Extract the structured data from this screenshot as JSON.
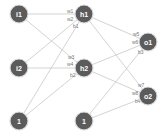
{
  "diagram": {
    "type": "neural-network",
    "layers": [
      "input",
      "hidden",
      "output"
    ],
    "nodes": [
      {
        "id": "i1",
        "label": "i1",
        "x": 19,
        "y": 14
      },
      {
        "id": "i2",
        "label": "i2",
        "x": 19,
        "y": 68
      },
      {
        "id": "b_in",
        "label": "1",
        "x": 19,
        "y": 121
      },
      {
        "id": "h1",
        "label": "h1",
        "x": 84,
        "y": 14
      },
      {
        "id": "h2",
        "label": "h2",
        "x": 84,
        "y": 68
      },
      {
        "id": "b_hid",
        "label": "1",
        "x": 84,
        "y": 121
      },
      {
        "id": "o1",
        "label": "o1",
        "x": 148,
        "y": 42
      },
      {
        "id": "o2",
        "label": "o2",
        "x": 148,
        "y": 96
      }
    ],
    "edges": [
      {
        "from": "i1",
        "to": "h1",
        "label": "w1",
        "lx": 67,
        "ly": 13
      },
      {
        "from": "i2",
        "to": "h1",
        "label": "w2",
        "lx": 67,
        "ly": 21
      },
      {
        "from": "b_in",
        "to": "h1",
        "label": "b1",
        "lx": 73,
        "ly": 28
      },
      {
        "from": "i1",
        "to": "h2",
        "label": "w3",
        "lx": 68,
        "ly": 59
      },
      {
        "from": "i2",
        "to": "h2",
        "label": "w4",
        "lx": 67,
        "ly": 66
      },
      {
        "from": "b_in",
        "to": "h2",
        "label": "b2",
        "lx": 70,
        "ly": 77
      },
      {
        "from": "h1",
        "to": "o1",
        "label": "w5",
        "lx": 133,
        "ly": 36
      },
      {
        "from": "h2",
        "to": "o1",
        "label": "w6",
        "lx": 132,
        "ly": 44
      },
      {
        "from": "b_hid",
        "to": "o1",
        "label": "b3",
        "lx": 138,
        "ly": 54
      },
      {
        "from": "h1",
        "to": "o2",
        "label": "w7",
        "lx": 138,
        "ly": 87
      },
      {
        "from": "h2",
        "to": "o2",
        "label": "w8",
        "lx": 132,
        "ly": 95
      },
      {
        "from": "b_hid",
        "to": "o2",
        "label": "b4",
        "lx": 135,
        "ly": 103
      }
    ],
    "colors": {
      "node_fill": "#5b5b5b",
      "node_text": "#ffffff",
      "edge": "#c8c8c8",
      "edge_label": "#777777"
    }
  }
}
